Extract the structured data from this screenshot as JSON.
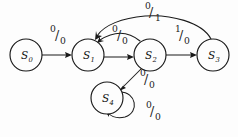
{
  "diagram": {
    "type": "state-transition-diagram",
    "colors": {
      "background": "#fdfdfd",
      "stroke": "#1a1a1a",
      "text": "#111111"
    },
    "states": [
      {
        "id": "S0",
        "letter": "S",
        "subscript": "0",
        "cx": 26,
        "cy": 55,
        "r": 16
      },
      {
        "id": "S1",
        "letter": "S",
        "subscript": "1",
        "cx": 88,
        "cy": 55,
        "r": 16
      },
      {
        "id": "S2",
        "letter": "S",
        "subscript": "2",
        "cx": 150,
        "cy": 55,
        "r": 16
      },
      {
        "id": "S3",
        "letter": "S",
        "subscript": "3",
        "cx": 213,
        "cy": 55,
        "r": 16
      },
      {
        "id": "S4",
        "letter": "S",
        "subscript": "4",
        "cx": 107,
        "cy": 98,
        "r": 16
      }
    ],
    "transitions": [
      {
        "id": "t0",
        "from": "S0",
        "to": "S1",
        "input": "0",
        "output": "0",
        "shape": "straight",
        "label_x": 57,
        "label_y": 36
      },
      {
        "id": "t1",
        "from": "S1",
        "to": "S2",
        "input": "0",
        "output": "0",
        "shape": "straight",
        "label_x": 119,
        "label_y": 36
      },
      {
        "id": "t2",
        "from": "S2",
        "to": "S1",
        "input": "0",
        "output": "0",
        "shape": "curve-back",
        "label_x": 119,
        "label_y": 36
      },
      {
        "id": "t3",
        "from": "S2",
        "to": "S3",
        "input": "1",
        "output": "0",
        "shape": "straight",
        "label_x": 181,
        "label_y": 36
      },
      {
        "id": "t4",
        "from": "S3",
        "to": "S1",
        "input": "0",
        "output": "1",
        "shape": "arc-top",
        "label_x": 151,
        "label_y": 12
      },
      {
        "id": "t5",
        "from": "S2",
        "to": "S4",
        "input": "0",
        "output": "0",
        "shape": "diagonal",
        "label_x": 146,
        "label_y": 80
      },
      {
        "id": "t6",
        "from": "S4",
        "to": "S4",
        "input": "0",
        "output": "0",
        "shape": "self-loop",
        "label_x": 152,
        "label_y": 112
      }
    ],
    "edge_labels": {
      "s0_s1": {
        "input": "0",
        "output": "0"
      },
      "s1_s2": {
        "input": "0",
        "output": "0"
      },
      "s2_s1": {
        "input": "0",
        "output": "0"
      },
      "s2_s3": {
        "input": "1",
        "output": "0"
      },
      "s3_s1_arc": {
        "input": "0",
        "output": "1"
      },
      "s2_s4": {
        "input": "0",
        "output": "0"
      },
      "s4_self": {
        "input": "0",
        "output": "0"
      }
    }
  }
}
